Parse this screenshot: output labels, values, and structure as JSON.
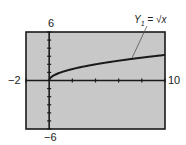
{
  "chart_data": {
    "type": "line",
    "title": "",
    "series": [
      {
        "name": "Y1 = √x",
        "function": "sqrt(x)",
        "x": [
          0,
          0.5,
          1,
          2,
          3,
          4,
          5,
          6,
          7,
          8,
          9,
          10
        ],
        "values": [
          0,
          0.71,
          1,
          1.41,
          1.73,
          2,
          2.24,
          2.45,
          2.65,
          2.83,
          3,
          3.16
        ]
      }
    ],
    "xlim": [
      -2,
      10
    ],
    "ylim": [
      -6,
      6
    ],
    "xscale": 2,
    "yscale": 1,
    "grid": false,
    "annotation": "Y1 = √x",
    "xlabel": "",
    "ylabel": ""
  },
  "labels": {
    "ymax": "6",
    "ymin": "−6",
    "xmin": "−2",
    "xmax": "10",
    "series_label_y": "Y",
    "series_label_sub": "1",
    "series_label_eq": " = √x"
  },
  "colors": {
    "screen": "#c8c8c8",
    "frame": "#1a1a1a",
    "curve": "#1a1a1a"
  }
}
